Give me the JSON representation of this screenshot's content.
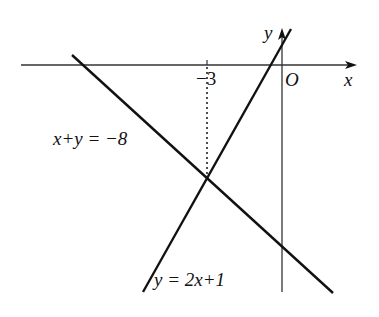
{
  "diagram": {
    "type": "coordinate-plane-linear-system",
    "axes": {
      "x_label": "x",
      "y_label": "y",
      "origin_label": "O"
    },
    "tick_labels": [
      {
        "value": "-3",
        "text": "−3"
      }
    ],
    "lines": [
      {
        "name": "line-x-plus-y",
        "equation": "x+y = −8",
        "label_text": "x+y = −8"
      },
      {
        "name": "line-y-2x-plus-1",
        "equation": "y = 2x+1",
        "label_text": "y = 2x+1"
      }
    ],
    "intersection": {
      "x": -3,
      "note": "dotted vertical guide from intersection to x = -3"
    },
    "colors": {
      "line": "#111111",
      "axis": "#333333",
      "background": "#ffffff"
    }
  }
}
